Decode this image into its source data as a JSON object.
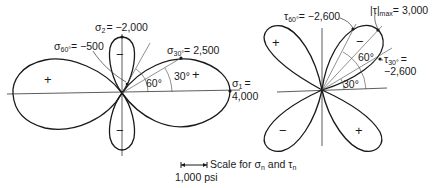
{
  "figure": {
    "left_panel": {
      "title": "Normal stress polar plot",
      "sigma2_label": "σ₂ = −2,000",
      "sigma2_symbol": "σ",
      "sigma2_sub": "2",
      "sigma2_value": "= −2,000",
      "sigma60_symbol": "σ",
      "sigma60_sub": "60°",
      "sigma60_value": "= −500",
      "sigma30_symbol": "σ",
      "sigma30_sub": "30°",
      "sigma30_value": "= 2,500",
      "sigma1_symbol": "σ",
      "sigma1_sub": "1",
      "sigma1_eq": "=",
      "sigma1_value": "4,000",
      "angle_60": "60°",
      "angle_30": "30°",
      "signs": {
        "left_lobe": "+",
        "right_lobe": "+",
        "top_lobe": "−",
        "bottom_lobe": "−"
      }
    },
    "right_panel": {
      "title": "Shear stress polar plot",
      "tau60_symbol": "τ",
      "tau60_sub": "60°",
      "tau60_value": "= −2,600",
      "taumax_symbol": "|τ|",
      "taumax_sub": "max",
      "taumax_value": "= 3,000",
      "tau30_symbol": "τ",
      "tau30_sub": "30°",
      "tau30_eq": "=",
      "tau30_value": "−2,600",
      "angle_60": "60°",
      "angle_30": "30°",
      "signs": {
        "upper_left": "+",
        "upper_right": "−",
        "lower_left": "−",
        "lower_right": "+"
      }
    },
    "scale": {
      "caption_prefix": "Scale for",
      "sigma_symbol": "σ",
      "sigma_sub": "n",
      "and": "and",
      "tau_symbol": "τ",
      "tau_sub": "n",
      "bar_label": "1,000 psi"
    }
  }
}
